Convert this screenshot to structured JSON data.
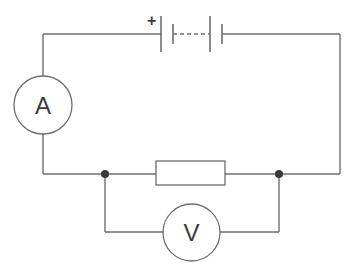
{
  "diagram": {
    "type": "circuit",
    "battery": {
      "polarity_label": "+",
      "cells": 2,
      "dashed_link": true
    },
    "ammeter": {
      "label": "A"
    },
    "voltmeter": {
      "label": "V"
    },
    "resistor": {
      "label": ""
    },
    "junctions": 2,
    "colors": {
      "wire": "#6e6e6e",
      "text": "#3c3c3c",
      "junction": "#3a3a3a",
      "background": "#ffffff"
    }
  }
}
